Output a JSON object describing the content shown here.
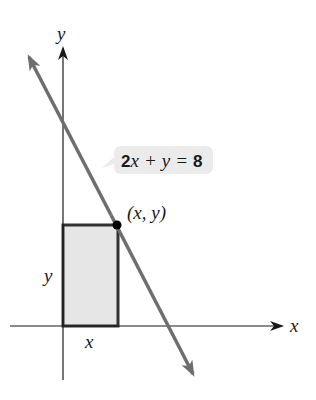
{
  "diagram": {
    "axes": {
      "x_label": "x",
      "y_label": "y",
      "color": "#1a1a1a"
    },
    "line": {
      "equation_coef": "2",
      "equation_var1": "x",
      "equation_plus": "+",
      "equation_var2": "y",
      "equation_eq": "=",
      "equation_rhs": "8",
      "color": "#6e6e6e"
    },
    "point": {
      "label": "(x, y)",
      "color": "#000000"
    },
    "rectangle": {
      "width_label": "x",
      "height_label": "y",
      "fill": "#e6e6e6",
      "stroke": "#333333"
    },
    "label_box": {
      "fill": "#ebebeb"
    }
  }
}
